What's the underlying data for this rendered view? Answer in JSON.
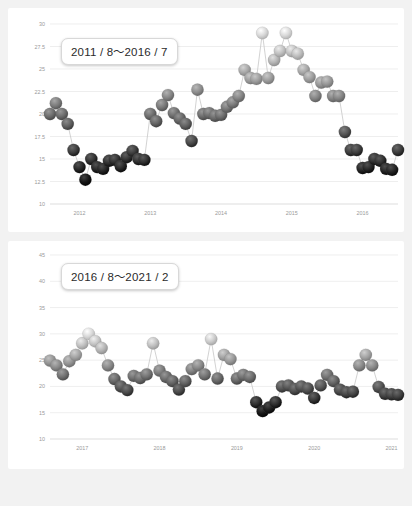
{
  "page": {
    "background_color": "#f2f2f2",
    "card_color": "#ffffff"
  },
  "charts": [
    {
      "badge_label": "2011 / 8〜2016 / 7",
      "name": "chart-top"
    },
    {
      "badge_label": "2016 / 8〜2021 / 2",
      "name": "chart-bottom"
    }
  ],
  "chart_data": [
    {
      "type": "line",
      "title": "2011 / 8〜2016 / 7",
      "xlabel": "",
      "ylabel": "",
      "ylim": [
        10,
        30
      ],
      "yticks": [
        10,
        12.5,
        15,
        17.5,
        20,
        22.5,
        25,
        27.5,
        30
      ],
      "ytick_labels": [
        "10",
        "12.5",
        "15",
        "17.5",
        "20",
        "22.5",
        "25",
        "27.5",
        "30"
      ],
      "xticks": [
        "2012",
        "2013",
        "2014",
        "2015",
        "2016"
      ],
      "xtick_positions": [
        5,
        17,
        29,
        41,
        53
      ],
      "grid": true,
      "legend": "none",
      "marker_style": "3d-sphere-gradient-by-value",
      "marker_color_high": "#d8d8d8",
      "marker_color_low": "#141414",
      "line_color": "#c6c6c6",
      "x": [
        "2011-08",
        "2011-09",
        "2011-10",
        "2011-11",
        "2011-12",
        "2012-01",
        "2012-02",
        "2012-03",
        "2012-04",
        "2012-05",
        "2012-06",
        "2012-07",
        "2012-08",
        "2012-09",
        "2012-10",
        "2012-11",
        "2012-12",
        "2013-01",
        "2013-02",
        "2013-03",
        "2013-04",
        "2013-05",
        "2013-06",
        "2013-07",
        "2013-08",
        "2013-09",
        "2013-10",
        "2013-11",
        "2013-12",
        "2014-01",
        "2014-02",
        "2014-03",
        "2014-04",
        "2014-05",
        "2014-06",
        "2014-07",
        "2014-08",
        "2014-09",
        "2014-10",
        "2014-11",
        "2014-12",
        "2015-01",
        "2015-02",
        "2015-03",
        "2015-04",
        "2015-05",
        "2015-06",
        "2015-07",
        "2015-08",
        "2015-09",
        "2015-10",
        "2015-11",
        "2015-12",
        "2016-01",
        "2016-02",
        "2016-03",
        "2016-04",
        "2016-05",
        "2016-06",
        "2016-07"
      ],
      "values": [
        20.0,
        21.2,
        20.0,
        18.9,
        16.0,
        14.1,
        12.7,
        15.0,
        14.1,
        13.9,
        14.8,
        14.9,
        14.2,
        15.2,
        15.9,
        15.0,
        14.9,
        20.0,
        19.2,
        21.0,
        22.1,
        20.1,
        19.5,
        18.9,
        17.0,
        22.7,
        20.0,
        20.1,
        19.8,
        19.9,
        20.8,
        21.3,
        22.0,
        24.9,
        24.0,
        23.9,
        29.0,
        24.0,
        26.0,
        27.0,
        29.0,
        27.0,
        26.7,
        24.9,
        24.1,
        22.0,
        23.5,
        23.6,
        22.0,
        22.0,
        18.0,
        16.0,
        16.0,
        14.0,
        14.1,
        15.0,
        14.8,
        13.9,
        13.8,
        16.0
      ],
      "values_tail": [
        16.0,
        17.1,
        20.0,
        20.0,
        22.7
      ]
    },
    {
      "type": "line",
      "title": "2016 / 8〜2021 / 2",
      "xlabel": "",
      "ylabel": "",
      "ylim": [
        10,
        45
      ],
      "yticks": [
        10,
        15,
        20,
        25,
        30,
        35,
        40,
        45
      ],
      "ytick_labels": [
        "10",
        "15",
        "20",
        "25",
        "30",
        "35",
        "40",
        "45"
      ],
      "xticks": [
        "2017",
        "2018",
        "2019",
        "2020",
        "2021"
      ],
      "xtick_positions": [
        5,
        17,
        29,
        41,
        53
      ],
      "grid": true,
      "legend": "none",
      "marker_style": "3d-sphere-gradient-by-value",
      "marker_color_high": "#d8d8d8",
      "marker_color_low": "#141414",
      "line_color": "#c6c6c6",
      "x": [
        "2016-08",
        "2016-09",
        "2016-10",
        "2016-11",
        "2016-12",
        "2017-01",
        "2017-02",
        "2017-03",
        "2017-04",
        "2017-05",
        "2017-06",
        "2017-07",
        "2017-08",
        "2017-09",
        "2017-10",
        "2017-11",
        "2017-12",
        "2018-01",
        "2018-02",
        "2018-03",
        "2018-04",
        "2018-05",
        "2018-06",
        "2018-07",
        "2018-08",
        "2018-09",
        "2018-10",
        "2018-11",
        "2018-12",
        "2019-01",
        "2019-02",
        "2019-03",
        "2019-04",
        "2019-05",
        "2019-06",
        "2019-07",
        "2019-08",
        "2019-09",
        "2019-10",
        "2019-11",
        "2019-12",
        "2020-01",
        "2020-02",
        "2020-03",
        "2020-04",
        "2020-05",
        "2020-06",
        "2020-07",
        "2020-08",
        "2020-09",
        "2020-10",
        "2020-11",
        "2020-12",
        "2021-01",
        "2021-02"
      ],
      "values": [
        24.9,
        24.0,
        22.3,
        24.8,
        26.0,
        28.2,
        30.0,
        28.6,
        27.3,
        24.0,
        21.4,
        20.0,
        19.3,
        22.0,
        21.6,
        22.3,
        28.2,
        23.0,
        21.8,
        21.0,
        19.4,
        21.0,
        23.3,
        24.0,
        22.3,
        29.0,
        21.5,
        26.0,
        25.2,
        21.5,
        22.2,
        21.8,
        17.0,
        15.3,
        16.0,
        17.0,
        20.0,
        20.2,
        19.5,
        20.0,
        19.6,
        17.8,
        20.2,
        22.2,
        21.0,
        19.4,
        18.9,
        19.0,
        24.0,
        26.0,
        24.0,
        19.9,
        18.6,
        18.5,
        18.4
      ]
    }
  ],
  "footnote": ""
}
